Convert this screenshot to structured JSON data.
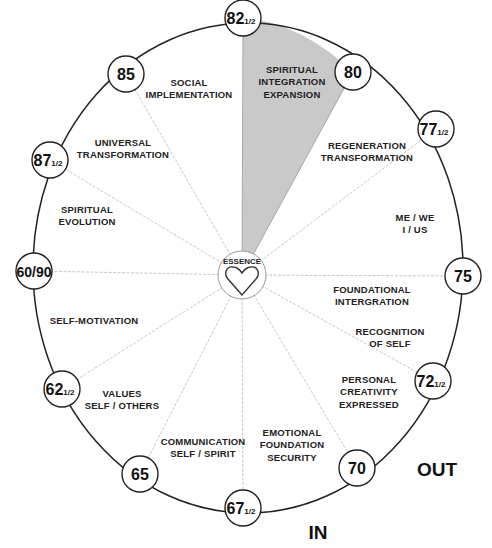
{
  "diagram": {
    "center": {
      "label": "ESSENCE",
      "icon": "heart-icon"
    },
    "nodes": [
      {
        "id": "n82",
        "whole": "82",
        "frac": "1/2",
        "x": 243,
        "y": 18
      },
      {
        "id": "n80",
        "whole": "80",
        "frac": "",
        "x": 353,
        "y": 72
      },
      {
        "id": "n77",
        "whole": "77",
        "frac": "1/2",
        "x": 436,
        "y": 129
      },
      {
        "id": "n75",
        "whole": "75",
        "frac": "",
        "x": 463,
        "y": 276
      },
      {
        "id": "n72",
        "whole": "72",
        "frac": "1/2",
        "x": 433,
        "y": 381
      },
      {
        "id": "n70",
        "whole": "70",
        "frac": "",
        "x": 357,
        "y": 468
      },
      {
        "id": "n67",
        "whole": "67",
        "frac": "1/2",
        "x": 243,
        "y": 508
      },
      {
        "id": "n65",
        "whole": "65",
        "frac": "",
        "x": 140,
        "y": 474
      },
      {
        "id": "n62",
        "whole": "62",
        "frac": "1/2",
        "x": 62,
        "y": 389
      },
      {
        "id": "n60",
        "whole": "60/90",
        "frac": "",
        "x": 34,
        "y": 271
      },
      {
        "id": "n87",
        "whole": "87",
        "frac": "1/2",
        "x": 50,
        "y": 160
      },
      {
        "id": "n85",
        "whole": "85",
        "frac": "",
        "x": 126,
        "y": 74
      }
    ],
    "segments": [
      {
        "lines": [
          "SPIRITUAL",
          "INTEGRATION",
          "EXPANSION"
        ],
        "x": 292,
        "y": 82,
        "highlighted": true
      },
      {
        "lines": [
          "REGENERATION",
          "TRANSFORMATION"
        ],
        "x": 367,
        "y": 152
      },
      {
        "lines": [
          "ME / WE",
          "I / US"
        ],
        "x": 415,
        "y": 224
      },
      {
        "lines": [
          "FOUNDATIONAL",
          "INTERGRATION"
        ],
        "x": 372,
        "y": 296
      },
      {
        "lines": [
          "RECOGNITION",
          "OF SELF"
        ],
        "x": 390,
        "y": 338
      },
      {
        "lines": [
          "PERSONAL",
          "CREATIVITY",
          "EXPRESSED"
        ],
        "x": 369,
        "y": 392
      },
      {
        "lines": [
          "EMOTIONAL",
          "FOUNDATION",
          "SECURITY"
        ],
        "x": 292,
        "y": 445
      },
      {
        "lines": [
          "COMMUNICATION",
          "SELF / SPIRIT"
        ],
        "x": 203,
        "y": 448
      },
      {
        "lines": [
          "VALUES",
          "SELF / OTHERS"
        ],
        "x": 122,
        "y": 400
      },
      {
        "lines": [
          "SELF-MOTIVATION"
        ],
        "x": 94,
        "y": 321
      },
      {
        "lines": [
          "SPIRITUAL",
          "EVOLUTION"
        ],
        "x": 87,
        "y": 216
      },
      {
        "lines": [
          "UNIVERSAL",
          "TRANSFORMATION"
        ],
        "x": 123,
        "y": 149
      },
      {
        "lines": [
          "SOCIAL",
          "IMPLEMENTATION"
        ],
        "x": 189,
        "y": 89
      }
    ],
    "direction_labels": {
      "out": "OUT",
      "in": "IN"
    },
    "colors": {
      "highlight": "#c9c9c9",
      "stroke": "#222222",
      "spoke": "#b8b8b8"
    }
  }
}
